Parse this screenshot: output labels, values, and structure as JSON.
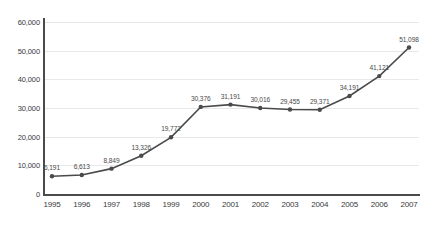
{
  "chart_data": {
    "type": "line",
    "title": "",
    "xlabel": "",
    "ylabel": "",
    "categories": [
      "1995",
      "1996",
      "1997",
      "1998",
      "1999",
      "2000",
      "2001",
      "2002",
      "2003",
      "2004",
      "2005",
      "2006",
      "2007"
    ],
    "values": [
      6191,
      6613,
      8849,
      13326,
      19772,
      30376,
      31191,
      30016,
      29455,
      29371,
      34191,
      41121,
      51098
    ],
    "value_labels": [
      "6,191",
      "6,613",
      "8,849",
      "13,326",
      "19,772",
      "30,376",
      "31,191",
      "30,016",
      "29,455",
      "29,371",
      "34,191",
      "41,121",
      "51,098"
    ],
    "ylim": [
      0,
      60000
    ],
    "ytick_labels": [
      "0",
      "10,000",
      "20,000",
      "30,000",
      "40,000",
      "50,000",
      "60,000"
    ],
    "ytick_values": [
      0,
      10000,
      20000,
      30000,
      40000,
      50000,
      60000
    ],
    "grid": true,
    "legend": "none",
    "series_color": "#4a4a4a",
    "grid_color": "#e8e8e8",
    "axis_color": "#4a4a4a",
    "marker": "circle",
    "show_data_labels": true
  }
}
